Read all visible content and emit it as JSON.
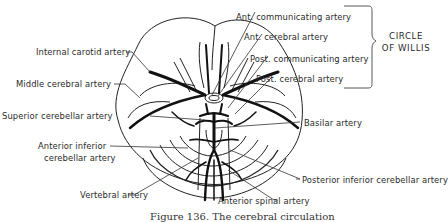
{
  "diagram": {
    "labels": {
      "ant_communicating": "Ant. communicating artery",
      "ant_cerebral": "Ant. cerebral artery",
      "post_communicating": "Post. communicating artery",
      "post_cerebral": "Post. cerebral artery",
      "internal_carotid": "Internal carotid artery",
      "middle_cerebral": "Middle cerebral artery",
      "superior_cerebellar": "Superior cerebellar artery",
      "basilar": "Basilar artery",
      "anterior_inferior_cerebellar_line1": "Anterior inferior",
      "anterior_inferior_cerebellar_line2": "cerebellar artery",
      "posterior_inferior_cerebellar": "Posterior inferior cerebellar artery",
      "vertebral": "Vertebral artery",
      "anterior_spinal": "Anterior spinal artery"
    },
    "group": {
      "line1": "CIRCLE",
      "line2": "OF WILLIS"
    },
    "caption": "Figure 136.   The cerebral circulation"
  }
}
